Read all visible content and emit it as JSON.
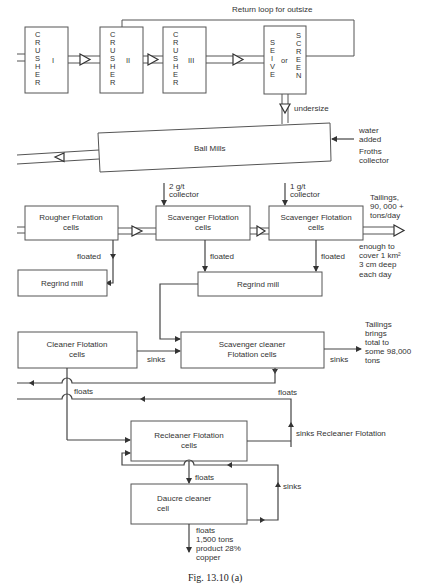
{
  "figure": {
    "caption": "Fig. 13.10 (a)",
    "return_loop_label": "Return loop for outsize",
    "crushers": [
      {
        "letters": [
          "C",
          "R",
          "U",
          "S",
          "H",
          "E",
          "R"
        ],
        "numeral": "I"
      },
      {
        "letters": [
          "C",
          "R",
          "U",
          "S",
          "H",
          "E",
          "R"
        ],
        "numeral": "II"
      },
      {
        "letters": [
          "C",
          "R",
          "U",
          "S",
          "H",
          "E",
          "R"
        ],
        "numeral": "III"
      }
    ],
    "sieve": {
      "left_letters": [
        "S",
        "E",
        "I",
        "V",
        "E"
      ],
      "middle": "or",
      "right_letters": [
        "S",
        "C",
        "R",
        "E",
        "E",
        "N"
      ]
    },
    "undersize_label": "undersize",
    "ball_mills": {
      "label": "Ball Mills",
      "inputs": [
        "water",
        "added",
        "Froths",
        "collector"
      ]
    },
    "collectors": [
      {
        "lines": [
          "2 g/t",
          "collector"
        ]
      },
      {
        "lines": [
          "1 g/t",
          "collector"
        ]
      }
    ],
    "boxes": {
      "rougher": [
        "Rougher Flotation",
        "cells"
      ],
      "scavenger1": [
        "Scavenger Flotation",
        "cells"
      ],
      "scavenger2": [
        "Scavenger Flotation",
        "cells"
      ],
      "regrind1": [
        "Regrind mill"
      ],
      "regrind2": [
        "Regrind mill"
      ],
      "cleaner": [
        "Cleaner Flotation",
        "cells"
      ],
      "scavenger_cleaner": [
        "Scavenger cleaner",
        "Flotation cells"
      ],
      "recleaner": [
        "Recleaner Flotation",
        "cells"
      ],
      "daucre": [
        "Daucre cleaner",
        "cell"
      ]
    },
    "labels": {
      "floated": "floated",
      "sinks": "sinks",
      "floats": "floats",
      "sinks_recleaner": "sinks Recleaner Flotation"
    },
    "tailings1": [
      "Tailings,",
      "90, 000 +",
      "tons/day"
    ],
    "tailings1_note": [
      "enough to",
      "cover 1 km²",
      "3 cm deep",
      "each day"
    ],
    "tailings2": [
      "Tailings",
      "brings",
      "total to",
      "some 98,000",
      "tons"
    ],
    "product": [
      "floats",
      "1,500 tons",
      "product 28%",
      "copper"
    ]
  }
}
